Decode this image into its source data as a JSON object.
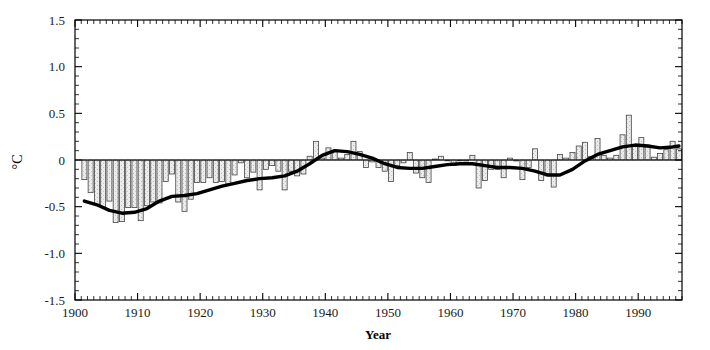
{
  "chart_data": {
    "type": "bar",
    "title": "",
    "subtitle": "",
    "xlabel": "Year",
    "ylabel": "°C",
    "xlim": [
      1900,
      1997
    ],
    "ylim": [
      -1.5,
      1.5
    ],
    "grid": false,
    "legend": null,
    "y_ticks": [
      "1.5",
      "1.0",
      "0.5",
      "0",
      "-0.5",
      "-1.0",
      "-1.5"
    ],
    "y_tick_values": [
      1.5,
      1.0,
      0.5,
      0,
      -0.5,
      -1.0,
      -1.5
    ],
    "y_minor_step": 0.1,
    "x_ticks": [
      "1900",
      "1910",
      "1920",
      "1930",
      "1940",
      "1950",
      "1960",
      "1970",
      "1980",
      "1990"
    ],
    "x_tick_values": [
      1900,
      1910,
      1920,
      1930,
      1940,
      1950,
      1960,
      1970,
      1980,
      1990
    ],
    "x_minor_step": 1,
    "bar_color": "#e8e8e8",
    "bar_edge_color": "#444444",
    "line_color": "#000000",
    "axis_color": "#000000",
    "categories": [
      1901,
      1902,
      1903,
      1904,
      1905,
      1906,
      1907,
      1908,
      1909,
      1910,
      1911,
      1912,
      1913,
      1914,
      1915,
      1916,
      1917,
      1918,
      1919,
      1920,
      1921,
      1922,
      1923,
      1924,
      1925,
      1926,
      1927,
      1928,
      1929,
      1930,
      1931,
      1932,
      1933,
      1934,
      1935,
      1936,
      1937,
      1938,
      1939,
      1940,
      1941,
      1942,
      1943,
      1944,
      1945,
      1946,
      1947,
      1948,
      1949,
      1950,
      1951,
      1952,
      1953,
      1954,
      1955,
      1956,
      1957,
      1958,
      1959,
      1960,
      1961,
      1962,
      1963,
      1964,
      1965,
      1966,
      1967,
      1968,
      1969,
      1970,
      1971,
      1972,
      1973,
      1974,
      1975,
      1976,
      1977,
      1978,
      1979,
      1980,
      1981,
      1982,
      1983,
      1984,
      1985,
      1986,
      1987,
      1988,
      1989,
      1990,
      1991,
      1992,
      1993,
      1994,
      1995,
      1996
    ],
    "values": [
      -0.21,
      -0.35,
      -0.48,
      -0.51,
      -0.44,
      -0.67,
      -0.66,
      -0.51,
      -0.51,
      -0.65,
      -0.49,
      -0.45,
      -0.46,
      -0.23,
      -0.15,
      -0.45,
      -0.55,
      -0.42,
      -0.24,
      -0.24,
      -0.19,
      -0.24,
      -0.23,
      -0.26,
      -0.16,
      -0.03,
      -0.19,
      -0.13,
      -0.32,
      -0.1,
      -0.06,
      -0.12,
      -0.32,
      -0.12,
      -0.17,
      -0.15,
      0.04,
      0.2,
      0.02,
      0.13,
      0.09,
      0.02,
      0.06,
      0.2,
      0.09,
      -0.08,
      -0.02,
      -0.08,
      -0.12,
      -0.23,
      -0.06,
      -0.03,
      0.08,
      -0.14,
      -0.19,
      -0.24,
      0.01,
      0.04,
      0.0,
      -0.06,
      0.0,
      -0.01,
      0.05,
      -0.3,
      -0.22,
      -0.1,
      -0.1,
      -0.19,
      0.02,
      -0.01,
      -0.21,
      -0.08,
      0.12,
      -0.22,
      -0.17,
      -0.29,
      0.06,
      0.02,
      0.08,
      0.15,
      0.19,
      0.04,
      0.23,
      0.05,
      0.02,
      0.05,
      0.27,
      0.48,
      0.16,
      0.24,
      0.16,
      0.03,
      0.07,
      0.11,
      0.2,
      0.12
    ],
    "smoothed_series": {
      "name": "filtered / smoothed trend",
      "x": [
        1901,
        1903,
        1905,
        1907,
        1909,
        1911,
        1913,
        1915,
        1917,
        1919,
        1921,
        1923,
        1925,
        1927,
        1929,
        1931,
        1933,
        1935,
        1937,
        1939,
        1941,
        1943,
        1945,
        1947,
        1949,
        1951,
        1953,
        1955,
        1957,
        1959,
        1961,
        1963,
        1965,
        1967,
        1969,
        1971,
        1973,
        1975,
        1977,
        1979,
        1981,
        1983,
        1985,
        1987,
        1989,
        1991,
        1993,
        1995,
        1996
      ],
      "y": [
        -0.44,
        -0.48,
        -0.54,
        -0.57,
        -0.56,
        -0.52,
        -0.44,
        -0.39,
        -0.38,
        -0.36,
        -0.32,
        -0.28,
        -0.25,
        -0.22,
        -0.2,
        -0.19,
        -0.17,
        -0.12,
        -0.04,
        0.05,
        0.1,
        0.09,
        0.06,
        0.02,
        -0.04,
        -0.08,
        -0.09,
        -0.09,
        -0.07,
        -0.05,
        -0.04,
        -0.04,
        -0.06,
        -0.08,
        -0.08,
        -0.09,
        -0.12,
        -0.16,
        -0.16,
        -0.1,
        -0.01,
        0.06,
        0.1,
        0.14,
        0.16,
        0.15,
        0.13,
        0.14,
        0.15
      ]
    }
  },
  "axis": {
    "x_title": "Year",
    "y_title": "°C"
  }
}
